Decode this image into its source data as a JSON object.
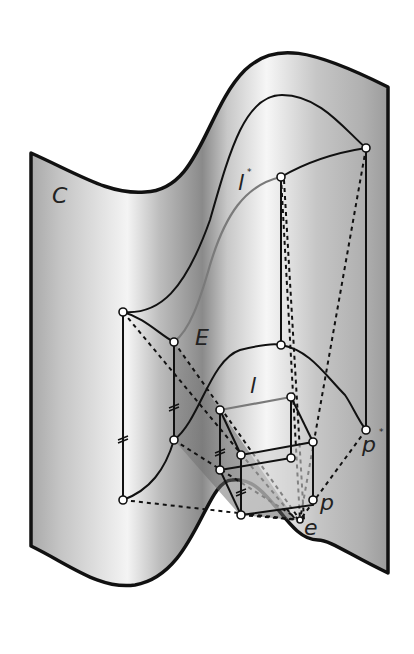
{
  "figure": {
    "labels": {
      "surface": "C",
      "curve_top": "l",
      "curve_top_mark": "*",
      "shaded_plane": "E",
      "box_line": "l",
      "point_p": "p",
      "point_p_star": "p",
      "point_p_star_mark": "*",
      "eye_point": "e"
    },
    "colors": {
      "outline": "#111111",
      "surface_light": "#f2f2f2",
      "surface_dark": "#8e8e8e",
      "highlight_curve": "#7a7a7a",
      "point_fill": "#ffffff"
    }
  }
}
